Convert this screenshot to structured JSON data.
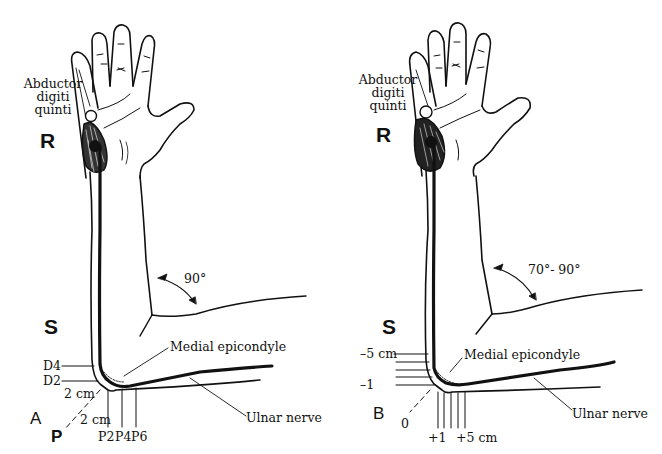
{
  "figure": {
    "panels": [
      {
        "id": "A",
        "panel_label": "A",
        "muscle_label_lines": [
          "Abductor",
          "digiti",
          "quinti"
        ],
        "recording_site_label": "R",
        "stimulation_site_label": "S",
        "elbow_angle_label": "90°",
        "landmark_label": "Medial epicondyle",
        "nerve_label": "Ulnar nerve",
        "distal_markers": [
          "D4",
          "D2"
        ],
        "proximal_markers": [
          "P2",
          "P4",
          "P6"
        ],
        "diagonal_distance_upper": "2 cm",
        "diagonal_distance_lower": "2 cm",
        "axis_end_label": "P"
      },
      {
        "id": "B",
        "panel_label": "B",
        "muscle_label_lines": [
          "Abductor",
          "digiti",
          "quinti"
        ],
        "recording_site_label": "R",
        "stimulation_site_label": "S",
        "elbow_angle_label": "70°- 90°",
        "landmark_label": "Medial epicondyle",
        "nerve_label": "Ulnar nerve",
        "distal_markers_top": "–5 cm",
        "distal_markers_bottom": "–1",
        "origin_label": "0",
        "proximal_marker_first": "+1",
        "proximal_marker_last": "+5 cm"
      }
    ],
    "colors": {
      "ink": "#111111",
      "background": "#ffffff"
    }
  }
}
